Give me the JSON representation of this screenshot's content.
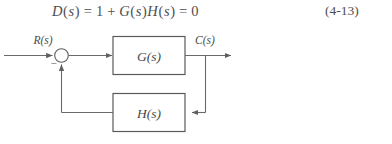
{
  "figure": {
    "kind": "control-system-block-diagram",
    "equation": {
      "text": "D(s)=1+G(s)H(s)=0",
      "lhs_function": "D",
      "variable": "s",
      "terms": [
        "1",
        "G(s)",
        "H(s)"
      ],
      "rhs": "0",
      "number": "(4-13)"
    },
    "diagram": {
      "input_label": "R(s)",
      "output_label": "C(s)",
      "forward_block_label": "G(s)",
      "feedback_block_label": "H(s)",
      "summing_junction_sign": "−",
      "line_color": "#666666",
      "block_border_color": "#5a5a5a",
      "background_color": "#ffffff",
      "text_color": "#4a4a4a"
    }
  }
}
